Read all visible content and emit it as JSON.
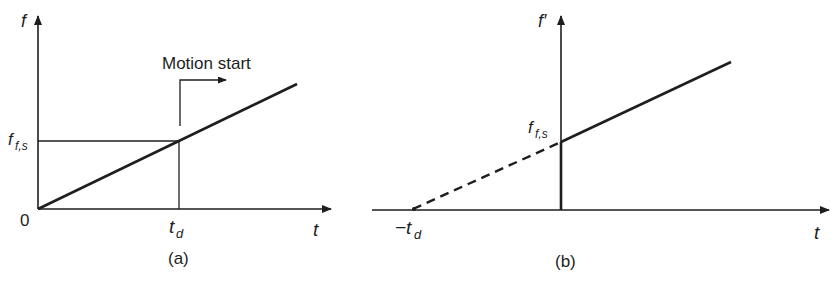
{
  "panels": [
    {
      "id": "a",
      "caption": "(a)",
      "y_axis_label": "f",
      "x_axis_label": "t",
      "origin_label": "0",
      "level_label_main": "f",
      "level_label_sub": "f,s",
      "time_label_main": "t",
      "time_label_sub": "d",
      "annotation": "Motion start"
    },
    {
      "id": "b",
      "caption": "(b)",
      "y_axis_label": "f′",
      "x_axis_label": "t",
      "level_label_main": "f",
      "level_label_sub": "f,s",
      "time_label_main": "−t",
      "time_label_sub": "d"
    }
  ],
  "colors": {
    "ink": "#1e1e1e",
    "background": "#ffffff"
  }
}
